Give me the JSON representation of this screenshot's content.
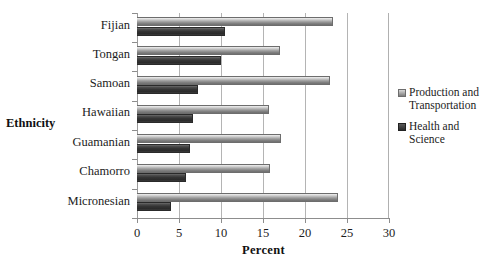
{
  "chart_data": {
    "type": "bar",
    "orientation": "horizontal",
    "title": "",
    "xlabel": "Percent",
    "ylabel": "Ethnicity",
    "categories": [
      "Fijian",
      "Tongan",
      "Samoan",
      "Hawaiian",
      "Guamanian",
      "Chamorro",
      "Micronesian"
    ],
    "series": [
      {
        "name": "Production and Transportation",
        "color": "#9c9c9c",
        "values": [
          23.3,
          17.0,
          23.0,
          15.7,
          17.2,
          15.8,
          23.9
        ]
      },
      {
        "name": "Health and Science",
        "color": "#343434",
        "values": [
          10.5,
          10.0,
          7.3,
          6.7,
          6.3,
          5.8,
          4.0
        ]
      }
    ],
    "xlim": [
      0,
      30
    ],
    "xticks": [
      0,
      5,
      10,
      15,
      20,
      25,
      30
    ],
    "xtick_labels": [
      "0",
      "5",
      "10",
      "15",
      "20",
      "25",
      "30"
    ],
    "grid": true,
    "grid_axis": "x",
    "legend_position": "right"
  },
  "axis": {
    "x_title": "Percent",
    "y_title": "Ethnicity"
  },
  "legend": {
    "entries": [
      {
        "label": "Production and Transportation",
        "swatch": "legend-swatch-light"
      },
      {
        "label": "Health and Science",
        "swatch": "legend-swatch-dark"
      }
    ]
  }
}
